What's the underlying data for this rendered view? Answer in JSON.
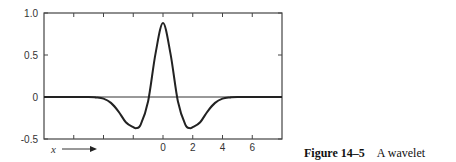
{
  "figure": {
    "label": "Figure 14–5",
    "caption": "A wavelet",
    "x_variable": "x"
  },
  "chart_data": {
    "type": "line",
    "title": "",
    "xlabel": "x",
    "ylabel": "",
    "xlim": [
      -8,
      8
    ],
    "ylim": [
      -0.5,
      1.0
    ],
    "x_ticks": [
      -6,
      -4,
      -2,
      0,
      2,
      4,
      6
    ],
    "x_tick_labels": [
      "",
      "",
      "",
      "0",
      "2",
      "4",
      "6"
    ],
    "y_ticks": [
      -0.5,
      0,
      0.5,
      1.0
    ],
    "y_tick_labels": [
      "-0.5",
      "0",
      "0.5",
      "1.0"
    ],
    "grid": false,
    "zero_line": true,
    "series": [
      {
        "name": "wavelet",
        "description": "Mexican-hat-like wavelet: peak ~0.88 at x=0, minima ~-0.37 at x≈±1.8, ~0 beyond |x|>4",
        "x": [
          -8,
          -5,
          -4.5,
          -4,
          -3.5,
          -3,
          -2.5,
          -2,
          -1.8,
          -1.5,
          -1,
          -0.5,
          0,
          0.5,
          1,
          1.5,
          1.8,
          2,
          2.5,
          3,
          3.5,
          4,
          4.5,
          5,
          8
        ],
        "y": [
          0,
          0,
          -0.005,
          -0.02,
          -0.07,
          -0.17,
          -0.3,
          -0.36,
          -0.37,
          -0.33,
          -0.05,
          0.52,
          0.88,
          0.52,
          -0.05,
          -0.33,
          -0.37,
          -0.36,
          -0.3,
          -0.17,
          -0.07,
          -0.02,
          -0.005,
          0,
          0
        ]
      }
    ]
  }
}
